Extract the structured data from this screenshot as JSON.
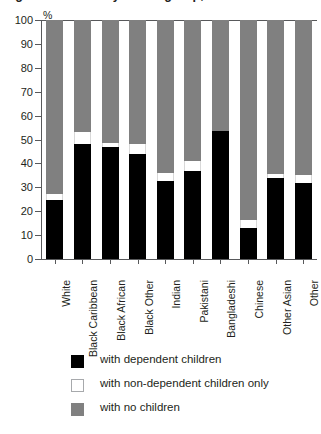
{
  "title": "Figure: Families by ethnic group, 2001",
  "axis": {
    "y_unit": "%",
    "y_ticks": [
      "100",
      "90",
      "80",
      "70",
      "60",
      "50",
      "40",
      "30",
      "20",
      "10",
      "0"
    ]
  },
  "legend": {
    "items": [
      {
        "label": "with dependent children",
        "swatch": "black-swatch",
        "color": "#000000"
      },
      {
        "label": "with non-dependent children only",
        "swatch": "white-swatch",
        "color": "#ffffff"
      },
      {
        "label": "with no children",
        "swatch": "gray-swatch",
        "color": "#808080"
      }
    ]
  },
  "chart_data": {
    "type": "bar",
    "stacked": true,
    "stack_total": 100,
    "title": "Figure: Families by ethnic group, 2001",
    "xlabel": "",
    "ylabel": "%",
    "ylim": [
      0,
      100
    ],
    "ytick_step": 10,
    "grid": false,
    "legend_position": "bottom-left",
    "categories": [
      "White",
      "Black Caribbean",
      "Black African",
      "Black Other",
      "Indian",
      "Pakistani",
      "Bangladeshi",
      "Chinese",
      "Other Asian",
      "Other"
    ],
    "series": [
      {
        "name": "with dependent children",
        "color": "#000000",
        "values": [
          24.5,
          48,
          47,
          44,
          32.5,
          37,
          53.5,
          13,
          34,
          32
        ]
      },
      {
        "name": "with non-dependent children only",
        "color": "#ffffff",
        "values": [
          2.5,
          5,
          1.5,
          4,
          3.5,
          4,
          0,
          3.5,
          1.5,
          3
        ]
      },
      {
        "name": "with no children",
        "color": "#808080",
        "values": [
          73,
          47,
          51.5,
          52,
          64,
          59,
          46.5,
          83.5,
          64.5,
          65
        ]
      }
    ]
  }
}
